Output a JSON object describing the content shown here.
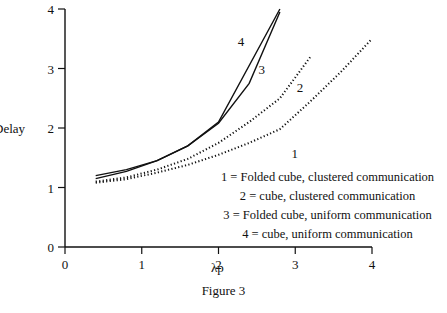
{
  "figure": {
    "caption": "Figure 3",
    "subcaption_cut": "Delay of... (text cut off at bottom edge)"
  },
  "chart_data": {
    "type": "line",
    "title": "",
    "xlabel": "λp",
    "ylabel": "Delay",
    "xlim": [
      0,
      4
    ],
    "ylim": [
      0,
      4
    ],
    "xticks": [
      "0",
      "1",
      "2",
      "3",
      "4"
    ],
    "yticks": [
      "0",
      "1",
      "2",
      "3",
      "4"
    ],
    "grid": false,
    "legend_position": "lower right (inside plot, text list)",
    "series": [
      {
        "id": "1",
        "name": "Folded cube, clustered communication",
        "style": "dotted",
        "x": [
          0.4,
          0.8,
          1.2,
          1.6,
          2.0,
          2.4,
          2.8,
          3.2,
          3.6,
          4.0
        ],
        "y": [
          1.08,
          1.14,
          1.25,
          1.38,
          1.55,
          1.75,
          1.98,
          2.45,
          2.95,
          3.5
        ],
        "label_pos": [
          2.95,
          1.5
        ]
      },
      {
        "id": "2",
        "name": "cube, clustered communication",
        "style": "dotted",
        "x": [
          0.4,
          0.8,
          1.2,
          1.6,
          2.0,
          2.4,
          2.8,
          3.2
        ],
        "y": [
          1.1,
          1.17,
          1.3,
          1.48,
          1.75,
          2.1,
          2.5,
          3.2
        ],
        "label_pos": [
          3.02,
          2.6
        ]
      },
      {
        "id": "3",
        "name": "Folded cube, uniform communication",
        "style": "solid",
        "x": [
          0.4,
          0.8,
          1.2,
          1.6,
          2.0,
          2.4,
          2.8
        ],
        "y": [
          1.15,
          1.27,
          1.45,
          1.7,
          2.08,
          2.75,
          3.95
        ],
        "label_pos": [
          2.52,
          2.9
        ]
      },
      {
        "id": "4",
        "name": "cube, uniform communication",
        "style": "solid",
        "x": [
          0.4,
          0.8,
          1.2,
          1.6,
          2.0,
          2.8
        ],
        "y": [
          1.2,
          1.3,
          1.45,
          1.7,
          2.1,
          4.0
        ],
        "label_pos": [
          2.25,
          3.38
        ]
      }
    ],
    "legend": [
      "1 = Folded cube, clustered communication",
      "2 = cube, clustered communication",
      "3 = Folded cube, uniform communication",
      "4 = cube, uniform communication"
    ]
  }
}
